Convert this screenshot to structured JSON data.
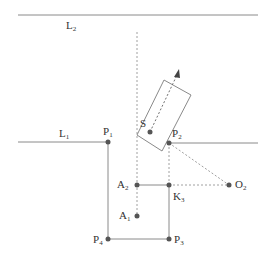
{
  "diagram": {
    "colors": {
      "solid_line": "#8a8a8a",
      "dashed_line": "#a0a0a0",
      "point": "#555555",
      "label": "#333333",
      "background": "#ffffff"
    },
    "lines": {
      "L2": {
        "label": "L",
        "sub": "2"
      },
      "L1": {
        "label": "L",
        "sub": "1"
      }
    },
    "points": {
      "P1": {
        "label": "P",
        "sub": "1"
      },
      "P2": {
        "label": "P",
        "sub": "2"
      },
      "P3": {
        "label": "P",
        "sub": "3"
      },
      "P4": {
        "label": "P",
        "sub": "4"
      },
      "S": {
        "label": "S",
        "sub": ""
      },
      "A1": {
        "label": "A",
        "sub": "1"
      },
      "A2": {
        "label": "A",
        "sub": "2"
      },
      "K3": {
        "label": "K",
        "sub": "3"
      },
      "O2": {
        "label": "O",
        "sub": "2"
      }
    }
  }
}
